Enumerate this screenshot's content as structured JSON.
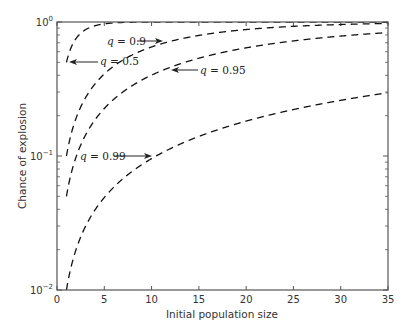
{
  "chart_data": {
    "type": "line",
    "title": "",
    "xlabel": "Initial population size",
    "ylabel": "Chance of explosion",
    "xlim": [
      0,
      35
    ],
    "ylim": [
      0.01,
      1
    ],
    "yscale": "log",
    "grid": false,
    "legend": "none (inline annotations with arrows)",
    "x_ticks": [
      "0",
      "5",
      "10",
      "15",
      "20",
      "25",
      "30",
      "35"
    ],
    "y_ticks": [
      {
        "base": "10",
        "exp": "0",
        "value": 1
      },
      {
        "base": "10",
        "exp": "−1",
        "value": 0.1
      },
      {
        "base": "10",
        "exp": "−2",
        "value": 0.01
      }
    ],
    "line_style": "dashed",
    "formula": "1 - q^n",
    "series": [
      {
        "name": "q = 0.5",
        "q": 0.5,
        "x": [
          1,
          2,
          3,
          4,
          5,
          6,
          8,
          10,
          15,
          20,
          25,
          30,
          35
        ],
        "values": [
          0.5,
          0.75,
          0.875,
          0.9375,
          0.969,
          0.984,
          0.996,
          0.999,
          1.0,
          1.0,
          1.0,
          1.0,
          1.0
        ]
      },
      {
        "name": "q = 0.9",
        "q": 0.9,
        "x": [
          1,
          2,
          3,
          4,
          5,
          6,
          8,
          10,
          15,
          20,
          25,
          30,
          35
        ],
        "values": [
          0.1,
          0.19,
          0.271,
          0.344,
          0.41,
          0.469,
          0.57,
          0.651,
          0.794,
          0.878,
          0.928,
          0.958,
          0.975
        ]
      },
      {
        "name": "q = 0.95",
        "q": 0.95,
        "x": [
          1,
          2,
          3,
          4,
          5,
          6,
          8,
          10,
          15,
          20,
          25,
          30,
          35
        ],
        "values": [
          0.05,
          0.0975,
          0.143,
          0.185,
          0.226,
          0.265,
          0.337,
          0.401,
          0.537,
          0.642,
          0.723,
          0.785,
          0.834
        ]
      },
      {
        "name": "q = 0.99",
        "q": 0.99,
        "x": [
          1,
          2,
          3,
          4,
          5,
          6,
          8,
          10,
          15,
          20,
          25,
          30,
          35
        ],
        "values": [
          0.01,
          0.0199,
          0.0297,
          0.0394,
          0.049,
          0.0585,
          0.0773,
          0.0956,
          0.14,
          0.182,
          0.222,
          0.26,
          0.297
        ]
      }
    ],
    "annotations": [
      {
        "q_symbol": "q",
        "text": " = 0.9",
        "points_to": "q = 0.9 curve near x≈8"
      },
      {
        "q_symbol": "q",
        "text": " = 0.5",
        "points_to": "q = 0.5 curve at x=1"
      },
      {
        "q_symbol": "q",
        "text": " = 0.95",
        "points_to": "q = 0.95 curve near x≈11"
      },
      {
        "q_symbol": "q",
        "text": " = 0.99",
        "points_to": "q = 0.99 curve near x≈10"
      }
    ]
  }
}
